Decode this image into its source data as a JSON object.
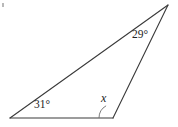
{
  "figure": {
    "kind": "geometry-triangle-diagram",
    "background_color": "#ffffff",
    "stroke_color": "#3a3a3a",
    "arc_color": "#6d6d6d",
    "text_color": "#232323",
    "width": 178,
    "height": 127,
    "vertices": {
      "bottom_left": {
        "x": 10,
        "y": 118
      },
      "bottom_right": {
        "x": 113,
        "y": 118
      },
      "apex": {
        "x": 168,
        "y": 5
      }
    },
    "edges": [
      {
        "name": "base",
        "from": "bottom_left",
        "to": "bottom_right"
      },
      {
        "name": "left-long-side",
        "from": "bottom_left",
        "to": "apex"
      },
      {
        "name": "right-side",
        "from": "bottom_right",
        "to": "apex"
      }
    ],
    "labels": {
      "bottom_left_angle": "31°",
      "apex_angle": "29°",
      "unknown_angle": "x"
    },
    "arc": {
      "at_vertex": "bottom_right",
      "radius": 14,
      "note": "small arc marking interior angle x"
    },
    "speck": {
      "x": 2,
      "y": 3,
      "w": 2,
      "h": 4
    }
  }
}
